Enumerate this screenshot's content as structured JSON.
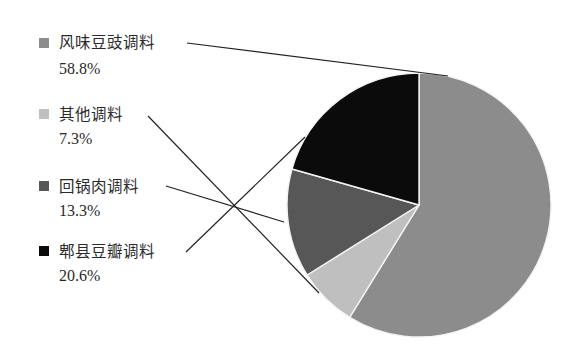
{
  "chart_data": {
    "type": "pie",
    "title": "",
    "start_angle": "12 o'clock",
    "direction": "clockwise",
    "legend_placement": "left",
    "slices": [
      {
        "label": "风味豆豉调料",
        "value": 58.8,
        "value_label": "58.8%",
        "color": "#8c8c8c"
      },
      {
        "label": "其他调料",
        "value": 7.3,
        "value_label": "7.3%",
        "color": "#bfbfbf"
      },
      {
        "label": "回锅肉调料",
        "value": 13.3,
        "value_label": "13.3%",
        "color": "#575757"
      },
      {
        "label": "郫县豆瓣调料",
        "value": 20.6,
        "value_label": "20.6%",
        "color": "#0b0b0b"
      }
    ],
    "legend_order": [
      0,
      1,
      2,
      3
    ]
  }
}
